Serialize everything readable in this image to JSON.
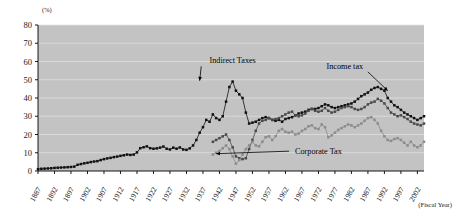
{
  "chart_data": {
    "type": "line",
    "title": "",
    "xlabel": "(Fiscal Year)",
    "ylabel": "(%)",
    "ylim": [
      0,
      80
    ],
    "ytick_values": [
      0,
      10,
      20,
      30,
      40,
      50,
      60,
      70,
      80
    ],
    "ytick_labels": [
      "0",
      "10",
      "20",
      "30",
      "40",
      "50",
      "60",
      "70",
      "80"
    ],
    "xlim": [
      1887,
      2004
    ],
    "xtick_values": [
      1887,
      1892,
      1897,
      1902,
      1907,
      1912,
      1917,
      1922,
      1927,
      1932,
      1937,
      1942,
      1947,
      1952,
      1957,
      1962,
      1967,
      1972,
      1977,
      1982,
      1987,
      1992,
      1997,
      2002
    ],
    "xtick_labels": [
      "1887",
      "1892",
      "1897",
      "1902",
      "1907",
      "1912",
      "1917",
      "1922",
      "1927",
      "1932",
      "1937",
      "1942",
      "1947",
      "1952",
      "1957",
      "1962",
      "1967",
      "1972",
      "1977",
      "1982",
      "1987",
      "1992",
      "1997",
      "2002"
    ],
    "grid": true,
    "legend_position": "annotations",
    "plot_background": "#c3c3c3",
    "annotations": [
      {
        "id": "indirect-taxes",
        "label": "Indirect Taxes",
        "text_x": 1946,
        "text_y": 59,
        "arrow_to_x": 1936,
        "arrow_to_y": 49.5
      },
      {
        "id": "income-tax",
        "label": "Income tax",
        "text_x": 1980,
        "text_y": 56,
        "arrow_to_x": 1993,
        "arrow_to_y": 44
      },
      {
        "id": "corporate-tax",
        "label": "Corporate Tax",
        "text_x": 1972,
        "text_y": 9.5,
        "arrow_to_x": 1941,
        "arrow_to_y": 9.5
      }
    ],
    "series": [
      {
        "name": "Indirect Taxes",
        "color": "#111111",
        "marker": "square",
        "x": [
          1887,
          1888,
          1889,
          1890,
          1891,
          1892,
          1893,
          1894,
          1895,
          1896,
          1897,
          1898,
          1899,
          1900,
          1901,
          1902,
          1903,
          1904,
          1905,
          1906,
          1907,
          1908,
          1909,
          1910,
          1911,
          1912,
          1913,
          1914,
          1915,
          1916,
          1917,
          1918,
          1919,
          1920,
          1921,
          1922,
          1923,
          1924,
          1925,
          1926,
          1927,
          1928,
          1929,
          1930,
          1931,
          1932,
          1933,
          1934,
          1935,
          1936,
          1937,
          1938,
          1939,
          1940,
          1941,
          1942,
          1943,
          1944,
          1945,
          1946,
          1947,
          1948,
          1949,
          1950,
          1951,
          1952,
          1953,
          1954,
          1955,
          1956,
          1957,
          1958,
          1959,
          1960,
          1961,
          1962,
          1963,
          1964,
          1965,
          1966,
          1967,
          1968,
          1969,
          1970,
          1971,
          1972,
          1973,
          1974,
          1975,
          1976,
          1977,
          1978,
          1979,
          1980,
          1981,
          1982,
          1983,
          1984,
          1985,
          1986,
          1987,
          1988,
          1989,
          1990,
          1991,
          1992,
          1993,
          1994,
          1995,
          1996,
          1997,
          1998,
          1999,
          2000,
          2001,
          2002,
          2003,
          2004
        ],
        "values": [
          1.0,
          1.2,
          1.3,
          1.4,
          1.5,
          1.7,
          1.8,
          1.9,
          2.0,
          2.1,
          2.2,
          2.4,
          3.4,
          3.8,
          4.2,
          4.5,
          4.9,
          5.2,
          5.4,
          6.0,
          6.5,
          6.9,
          7.2,
          7.6,
          7.9,
          8.3,
          8.6,
          9.0,
          8.8,
          9.0,
          10.2,
          12.5,
          13.0,
          13.5,
          12.5,
          12.2,
          12.4,
          12.8,
          13.4,
          12.2,
          11.8,
          12.8,
          12.2,
          12.9,
          11.8,
          11.6,
          12.4,
          14.0,
          17.0,
          21.0,
          24.0,
          28.0,
          27.0,
          31.0,
          29.0,
          28.0,
          30.0,
          38.0,
          46.0,
          49.0,
          44.0,
          42.0,
          40.0,
          32.0,
          26.0,
          26.5,
          27.0,
          28.0,
          29.0,
          29.5,
          29.0,
          28.0,
          27.5,
          28.0,
          27.0,
          28.5,
          29.0,
          29.5,
          30.5,
          31.5,
          32.0,
          32.5,
          33.5,
          34.0,
          34.0,
          34.5,
          35.5,
          36.5,
          36.0,
          35.0,
          34.5,
          35.0,
          35.5,
          36.0,
          36.5,
          37.0,
          38.0,
          39.5,
          41.0,
          42.0,
          43.0,
          44.5,
          45.5,
          46.0,
          45.0,
          44.0,
          40.0,
          38.0,
          36.0,
          35.0,
          33.5,
          32.0,
          31.0,
          30.0,
          29.0,
          28.0,
          29.0,
          30.0
        ]
      },
      {
        "name": "Income tax",
        "color": "#4a4a4a",
        "marker": "square",
        "x": [
          1940,
          1941,
          1942,
          1943,
          1944,
          1945,
          1946,
          1947,
          1948,
          1949,
          1950,
          1951,
          1952,
          1953,
          1954,
          1955,
          1956,
          1957,
          1958,
          1959,
          1960,
          1961,
          1962,
          1963,
          1964,
          1965,
          1966,
          1967,
          1968,
          1969,
          1970,
          1971,
          1972,
          1973,
          1974,
          1975,
          1976,
          1977,
          1978,
          1979,
          1980,
          1981,
          1982,
          1983,
          1984,
          1985,
          1986,
          1987,
          1988,
          1989,
          1990,
          1991,
          1992,
          1993,
          1994,
          1995,
          1996,
          1997,
          1998,
          1999,
          2000,
          2001,
          2002,
          2003,
          2004
        ],
        "values": [
          16.0,
          17.0,
          18.0,
          19.0,
          20.0,
          17.0,
          13.0,
          8.0,
          7.0,
          6.5,
          7.0,
          12.0,
          17.0,
          22.0,
          26.0,
          27.5,
          28.0,
          29.0,
          28.0,
          28.5,
          29.0,
          30.0,
          31.0,
          32.0,
          32.5,
          30.5,
          30.0,
          30.5,
          31.5,
          33.0,
          34.0,
          33.0,
          32.5,
          33.0,
          34.5,
          33.0,
          32.0,
          32.5,
          33.5,
          34.5,
          35.0,
          35.5,
          35.0,
          34.0,
          33.5,
          34.0,
          35.0,
          36.5,
          37.5,
          38.0,
          39.5,
          38.5,
          37.0,
          34.5,
          32.0,
          31.0,
          30.0,
          30.5,
          29.5,
          28.5,
          27.0,
          26.0,
          25.5,
          25.0,
          26.0
        ]
      },
      {
        "name": "Corporate Tax",
        "color": "#8c8c8c",
        "marker": "square",
        "x": [
          1940,
          1941,
          1942,
          1943,
          1944,
          1945,
          1946,
          1947,
          1948,
          1949,
          1950,
          1951,
          1952,
          1953,
          1954,
          1955,
          1956,
          1957,
          1958,
          1959,
          1960,
          1961,
          1962,
          1963,
          1964,
          1965,
          1966,
          1967,
          1968,
          1969,
          1970,
          1971,
          1972,
          1973,
          1974,
          1975,
          1976,
          1977,
          1978,
          1979,
          1980,
          1981,
          1982,
          1983,
          1984,
          1985,
          1986,
          1987,
          1988,
          1989,
          1990,
          1991,
          1992,
          1993,
          1994,
          1995,
          1996,
          1997,
          1998,
          1999,
          2000,
          2001,
          2002,
          2003,
          2004
        ],
        "values": [
          9.0,
          10.0,
          11.0,
          12.5,
          14.0,
          12.0,
          8.0,
          4.0,
          6.0,
          9.0,
          12.0,
          14.0,
          16.0,
          14.0,
          13.5,
          16.0,
          18.5,
          19.0,
          17.0,
          19.0,
          22.0,
          23.0,
          21.5,
          21.0,
          21.5,
          20.0,
          20.5,
          22.0,
          23.0,
          24.5,
          25.0,
          23.5,
          23.0,
          25.5,
          24.0,
          18.5,
          19.5,
          21.0,
          22.5,
          23.5,
          24.5,
          25.5,
          25.0,
          24.0,
          25.0,
          26.0,
          27.5,
          29.0,
          29.5,
          28.0,
          26.0,
          22.0,
          19.0,
          17.0,
          16.5,
          17.5,
          18.0,
          17.0,
          15.5,
          14.0,
          16.0,
          14.0,
          13.0,
          14.0,
          16.0
        ]
      }
    ]
  }
}
